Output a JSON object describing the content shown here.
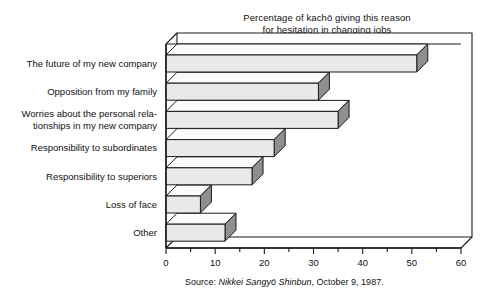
{
  "chart": {
    "title_lines": [
      "Percentage of kachō giving this reason",
      "for hesitation in changing jobs"
    ],
    "source_prefix": "Source: ",
    "source_italic": "Nikkei Sangyō Shinbun",
    "source_suffix": ", October 9, 1987.",
    "bar_fill": "#e9e9e9",
    "bar_side": "#8f8f8f",
    "bar_top": "#fbfbfb",
    "line_color": "#1a1a1a"
  },
  "chart_data": {
    "type": "bar",
    "orientation": "horizontal",
    "title": "Percentage of kachō giving this reason for hesitation in changing jobs",
    "xlabel": "",
    "ylabel": "",
    "xlim": [
      0,
      60
    ],
    "xticks": [
      0,
      10,
      20,
      30,
      40,
      50,
      60
    ],
    "xtick_labels": [
      "0",
      "10",
      "20",
      "30",
      "40",
      "50",
      "60"
    ],
    "minor_tick_step": 5,
    "grid": false,
    "legend": false,
    "style": "3d-isometric-bars",
    "categories": [
      "The future of my new company",
      "Opposition from my family",
      "Worries about the personal relationships in my new company",
      "Responsibility to subordinates",
      "Responsibility to superiors",
      "Loss of face",
      "Other"
    ],
    "category_label_lines": [
      [
        "The future of my new company"
      ],
      [
        "Opposition from my family"
      ],
      [
        "Worries about the personal rela-",
        "tionships in my new company"
      ],
      [
        "Responsibility to subordinates"
      ],
      [
        "Responsibility to superiors"
      ],
      [
        "Loss of face"
      ],
      [
        "Other"
      ]
    ],
    "values": [
      51,
      31,
      35,
      22,
      17.5,
      7,
      12
    ],
    "units": "percent"
  }
}
